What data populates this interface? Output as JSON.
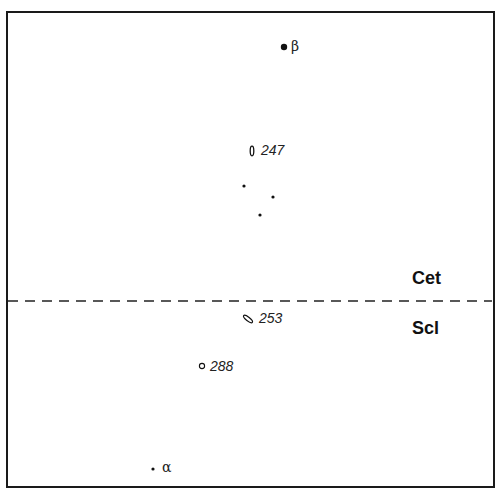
{
  "diagram": {
    "zones": {
      "upper": "Cet",
      "lower": "Scl"
    },
    "boundary": {
      "style": "dashed",
      "y": 301
    },
    "points": [
      {
        "id": "beta",
        "label": "β",
        "marker": "filled-dot",
        "x": 284,
        "y": 47
      },
      {
        "id": "247",
        "label": "247",
        "marker": "vertical-ellipse",
        "x": 252,
        "y": 151
      },
      {
        "id": "dot1",
        "label": "",
        "marker": "small-dot",
        "x": 244,
        "y": 186
      },
      {
        "id": "dot2",
        "label": "",
        "marker": "small-dot",
        "x": 273,
        "y": 197
      },
      {
        "id": "dot3",
        "label": "",
        "marker": "small-dot",
        "x": 260,
        "y": 215
      },
      {
        "id": "253",
        "label": "253",
        "marker": "tilted-ellipse",
        "x": 248,
        "y": 319
      },
      {
        "id": "288",
        "label": "288",
        "marker": "open-circle",
        "x": 202,
        "y": 366
      },
      {
        "id": "alpha",
        "label": "α",
        "marker": "small-dot",
        "x": 153,
        "y": 469
      }
    ]
  }
}
